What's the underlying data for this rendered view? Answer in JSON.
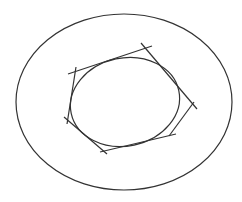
{
  "diagram": {
    "stroke_color": "#333333",
    "background": "#ffffff",
    "outer_ellipse": {
      "cx": 124,
      "cy": 102,
      "rx": 108,
      "ry": 88
    },
    "inner_ellipse": {
      "cx": 125,
      "cy": 102,
      "rx": 55,
      "ry": 44,
      "rotation": -12
    },
    "tangent_lines": [
      {
        "id": "top",
        "x1": 68,
        "y1": 74,
        "x2": 152,
        "y2": 46
      },
      {
        "id": "upper-right",
        "x1": 141,
        "y1": 43,
        "x2": 197,
        "y2": 109
      },
      {
        "id": "right-lower",
        "x1": 194,
        "y1": 102,
        "x2": 169,
        "y2": 136
      },
      {
        "id": "bottom",
        "x1": 176,
        "y1": 134,
        "x2": 100,
        "y2": 152
      },
      {
        "id": "lower-left",
        "x1": 107,
        "y1": 154,
        "x2": 64,
        "y2": 117
      },
      {
        "id": "left",
        "x1": 76,
        "y1": 67,
        "x2": 67,
        "y2": 124
      }
    ]
  }
}
